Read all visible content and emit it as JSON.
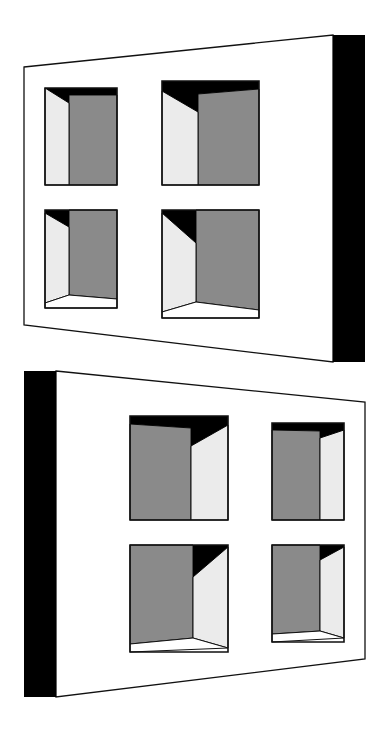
{
  "colors": {
    "background": "#ffffff",
    "wall": "#ffffff",
    "stroke": "#111111",
    "side_edge": "#000000",
    "back_wall": "#8a8a8a",
    "side_wall": "#ebebeb",
    "shadow": "#000000",
    "sill": "#ffffff"
  },
  "panels": [
    {
      "name": "top-panel",
      "wall": [
        [
          24,
          67
        ],
        [
          333,
          35
        ],
        [
          333,
          362
        ],
        [
          24,
          325
        ]
      ],
      "side_edge": [
        [
          333,
          35
        ],
        [
          365,
          35
        ],
        [
          365,
          362
        ],
        [
          333,
          362
        ]
      ],
      "windows": [
        {
          "name": "window-top-left",
          "frame": [
            [
              45,
              88
            ],
            [
              117,
              88
            ],
            [
              117,
              185
            ],
            [
              45,
              185
            ]
          ],
          "shadow": [
            [
              45,
              88
            ],
            [
              117,
              88
            ],
            [
              117,
              95
            ],
            [
              69,
              95
            ],
            [
              69,
              103
            ]
          ],
          "side": [
            [
              45,
              88
            ],
            [
              69,
              103
            ],
            [
              69,
              185
            ],
            [
              45,
              185
            ]
          ],
          "back": [
            [
              69,
              95
            ],
            [
              117,
              95
            ],
            [
              117,
              185
            ],
            [
              69,
              185
            ]
          ]
        },
        {
          "name": "window-top-right",
          "frame": [
            [
              162,
              81
            ],
            [
              259,
              81
            ],
            [
              259,
              185
            ],
            [
              162,
              185
            ]
          ],
          "shadow": [
            [
              162,
              81
            ],
            [
              259,
              81
            ],
            [
              259,
              89
            ],
            [
              198,
              94
            ],
            [
              198,
              112
            ],
            [
              162,
              91
            ]
          ],
          "side": [
            [
              162,
              91
            ],
            [
              198,
              112
            ],
            [
              198,
              185
            ],
            [
              162,
              185
            ]
          ],
          "back": [
            [
              198,
              94
            ],
            [
              259,
              89
            ],
            [
              259,
              185
            ],
            [
              198,
              185
            ]
          ]
        },
        {
          "name": "window-bottom-left",
          "frame": [
            [
              45,
              210
            ],
            [
              117,
              210
            ],
            [
              117,
              308
            ],
            [
              45,
              308
            ]
          ],
          "shadow": [
            [
              45,
              210
            ],
            [
              69,
              210
            ],
            [
              69,
              227
            ],
            [
              45,
              213
            ]
          ],
          "side": [
            [
              45,
              213
            ],
            [
              69,
              227
            ],
            [
              69,
              295
            ],
            [
              45,
              303
            ]
          ],
          "back": [
            [
              69,
              210
            ],
            [
              117,
              210
            ],
            [
              117,
              299
            ],
            [
              69,
              295
            ]
          ],
          "sill": [
            [
              45,
              303
            ],
            [
              69,
              295
            ],
            [
              117,
              299
            ],
            [
              117,
              308
            ],
            [
              45,
              308
            ]
          ]
        },
        {
          "name": "window-bottom-right",
          "frame": [
            [
              162,
              210
            ],
            [
              259,
              210
            ],
            [
              259,
              318
            ],
            [
              162,
              318
            ]
          ],
          "shadow": [
            [
              162,
              210
            ],
            [
              196,
              210
            ],
            [
              196,
              243
            ],
            [
              162,
              213
            ]
          ],
          "side": [
            [
              162,
              213
            ],
            [
              196,
              243
            ],
            [
              196,
              302
            ],
            [
              162,
              312
            ]
          ],
          "back": [
            [
              196,
              210
            ],
            [
              259,
              210
            ],
            [
              259,
              310
            ],
            [
              196,
              302
            ]
          ],
          "sill": [
            [
              162,
              312
            ],
            [
              196,
              302
            ],
            [
              259,
              310
            ],
            [
              259,
              318
            ],
            [
              162,
              318
            ]
          ]
        }
      ]
    },
    {
      "name": "bottom-panel",
      "wall": [
        [
          56,
          371
        ],
        [
          365,
          402
        ],
        [
          365,
          659
        ],
        [
          56,
          697
        ]
      ],
      "side_edge": [
        [
          24,
          371
        ],
        [
          56,
          371
        ],
        [
          56,
          697
        ],
        [
          24,
          697
        ]
      ],
      "windows": [
        {
          "name": "window-lower-top-left",
          "frame": [
            [
              130,
              416
            ],
            [
              228,
              416
            ],
            [
              228,
              520
            ],
            [
              130,
              520
            ]
          ],
          "shadow": [
            [
              130,
              416
            ],
            [
              228,
              416
            ],
            [
              228,
              425
            ],
            [
              191,
              446
            ],
            [
              191,
              428
            ],
            [
              130,
              424
            ]
          ],
          "back": [
            [
              130,
              424
            ],
            [
              191,
              428
            ],
            [
              191,
              520
            ],
            [
              130,
              520
            ]
          ],
          "side": [
            [
              191,
              446
            ],
            [
              228,
              425
            ],
            [
              228,
              520
            ],
            [
              191,
              520
            ]
          ]
        },
        {
          "name": "window-lower-top-right",
          "frame": [
            [
              272,
              423
            ],
            [
              344,
              423
            ],
            [
              344,
              520
            ],
            [
              272,
              520
            ]
          ],
          "shadow": [
            [
              272,
              423
            ],
            [
              344,
              423
            ],
            [
              344,
              430
            ],
            [
              320,
              438
            ],
            [
              320,
              431
            ],
            [
              272,
              430
            ]
          ],
          "back": [
            [
              272,
              430
            ],
            [
              320,
              431
            ],
            [
              320,
              520
            ],
            [
              272,
              520
            ]
          ],
          "side": [
            [
              320,
              438
            ],
            [
              344,
              430
            ],
            [
              344,
              520
            ],
            [
              320,
              520
            ]
          ]
        },
        {
          "name": "window-lower-bottom-left",
          "frame": [
            [
              130,
              545
            ],
            [
              228,
              545
            ],
            [
              228,
              652
            ],
            [
              130,
              652
            ]
          ],
          "shadow": [
            [
              193,
              545
            ],
            [
              228,
              545
            ],
            [
              228,
              547
            ],
            [
              193,
              577
            ]
          ],
          "back": [
            [
              130,
              545
            ],
            [
              193,
              545
            ],
            [
              193,
              638
            ],
            [
              130,
              644
            ]
          ],
          "side": [
            [
              193,
              577
            ],
            [
              228,
              547
            ],
            [
              228,
              648
            ],
            [
              193,
              638
            ]
          ],
          "sill": [
            [
              130,
              644
            ],
            [
              193,
              638
            ],
            [
              228,
              648
            ],
            [
              228,
              648
            ],
            [
              130,
              652
            ]
          ]
        },
        {
          "name": "window-lower-bottom-right",
          "frame": [
            [
              272,
              545
            ],
            [
              344,
              545
            ],
            [
              344,
              642
            ],
            [
              272,
              642
            ]
          ],
          "shadow": [
            [
              320,
              545
            ],
            [
              344,
              545
            ],
            [
              344,
              547
            ],
            [
              320,
              560
            ]
          ],
          "back": [
            [
              272,
              545
            ],
            [
              320,
              545
            ],
            [
              320,
              631
            ],
            [
              272,
              634
            ]
          ],
          "side": [
            [
              320,
              560
            ],
            [
              344,
              547
            ],
            [
              344,
              638
            ],
            [
              320,
              631
            ]
          ],
          "sill": [
            [
              272,
              634
            ],
            [
              320,
              631
            ],
            [
              344,
              638
            ],
            [
              344,
              638
            ],
            [
              272,
              642
            ]
          ]
        }
      ]
    }
  ]
}
